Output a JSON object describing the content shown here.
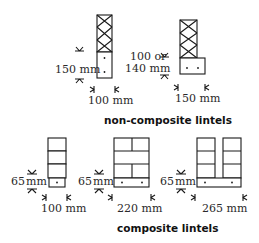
{
  "figure": {
    "sections": [
      {
        "caption": "non-composite lintels",
        "items": [
          {
            "id": "nc1",
            "height_label": "150 mm",
            "width_label": "100 mm",
            "wall": "cross-hatched (blockwork)",
            "dots": 2
          },
          {
            "id": "nc2",
            "height_label_line1": "100 or",
            "height_label_line2": "140 mm",
            "width_label": "150 mm",
            "wall": "cross-hatched (blockwork)",
            "dots": 2
          }
        ]
      },
      {
        "caption": "composite lintels",
        "items": [
          {
            "id": "c1",
            "height_label_num": "65",
            "height_label_unit": "mm",
            "width_label": "100 mm",
            "wall": "brick courses",
            "dots": 1
          },
          {
            "id": "c2",
            "height_label_num": "65",
            "height_label_unit": "mm",
            "width_label": "220 mm",
            "wall": "brick courses",
            "dots": 2
          },
          {
            "id": "c3",
            "height_label_num": "65",
            "height_label_unit": "mm",
            "width_label": "265 mm",
            "wall": "two brick leaves with cavity",
            "dots": 2
          }
        ]
      }
    ],
    "colors": {
      "line": "#1a1a1a",
      "text": "#2a2a2a",
      "background": "#ffffff"
    }
  }
}
